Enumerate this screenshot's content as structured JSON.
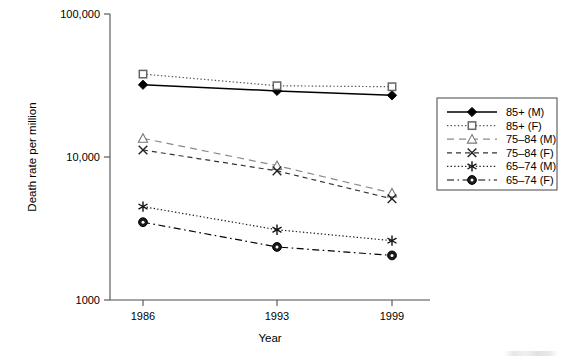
{
  "chart_data": {
    "type": "line",
    "title": "",
    "subtitle": "",
    "xlabel": "Year",
    "ylabel": "Death rate per million",
    "x": [
      1986,
      1993,
      1999
    ],
    "categories": [
      "1986",
      "1993",
      "1999"
    ],
    "xtick_labels": [
      "1986",
      "1993",
      "1999"
    ],
    "ytick_labels": [
      "1000",
      "10,000",
      "100,000"
    ],
    "ytick_values": [
      1000,
      10000,
      100000
    ],
    "yscale": "log",
    "ylim": [
      1000,
      100000
    ],
    "xlim": [
      1984.2,
      2000.8
    ],
    "grid": false,
    "legend_position": "right",
    "series": [
      {
        "name": "85+ (M)",
        "values": [
          32000,
          29000,
          27000
        ],
        "marker": "filled-diamond",
        "linestyle": "solid",
        "color": "#000000"
      },
      {
        "name": "85+ (F)",
        "values": [
          38000,
          31500,
          31000
        ],
        "marker": "open-square",
        "linestyle": "dotted",
        "color": "#555555"
      },
      {
        "name": "75–84 (M)",
        "values": [
          13500,
          8700,
          5600
        ],
        "marker": "open-triangle",
        "linestyle": "dashed-long",
        "color": "#8a8a8a"
      },
      {
        "name": "75–84 (F)",
        "values": [
          11200,
          8000,
          5100
        ],
        "marker": "cross-x",
        "linestyle": "dashed",
        "color": "#333333"
      },
      {
        "name": "65–74 (M)",
        "values": [
          4500,
          3100,
          2600
        ],
        "marker": "asterisk",
        "linestyle": "dotted",
        "color": "#222222"
      },
      {
        "name": "65–74 (F)",
        "values": [
          3500,
          2350,
          2050
        ],
        "marker": "filled-circle-ring",
        "linestyle": "dash-dot",
        "color": "#000000"
      }
    ]
  },
  "axes": {
    "y_title": "Death rate per million",
    "x_title": "Year",
    "y_ticks": [
      {
        "label": "100,000",
        "value": 100000
      },
      {
        "label": "10,000",
        "value": 10000
      },
      {
        "label": "1000",
        "value": 1000
      }
    ],
    "x_ticks": [
      {
        "label": "1986",
        "value": 1986
      },
      {
        "label": "1993",
        "value": 1993
      },
      {
        "label": "1999",
        "value": 1999
      }
    ]
  },
  "legend": {
    "entries": [
      {
        "label": "85+ (M)"
      },
      {
        "label": "85+ (F)"
      },
      {
        "label": "75–84 (M)"
      },
      {
        "label": "75–84 (F)"
      },
      {
        "label": "65–74 (M)"
      },
      {
        "label": "65–74 (F)"
      }
    ]
  }
}
